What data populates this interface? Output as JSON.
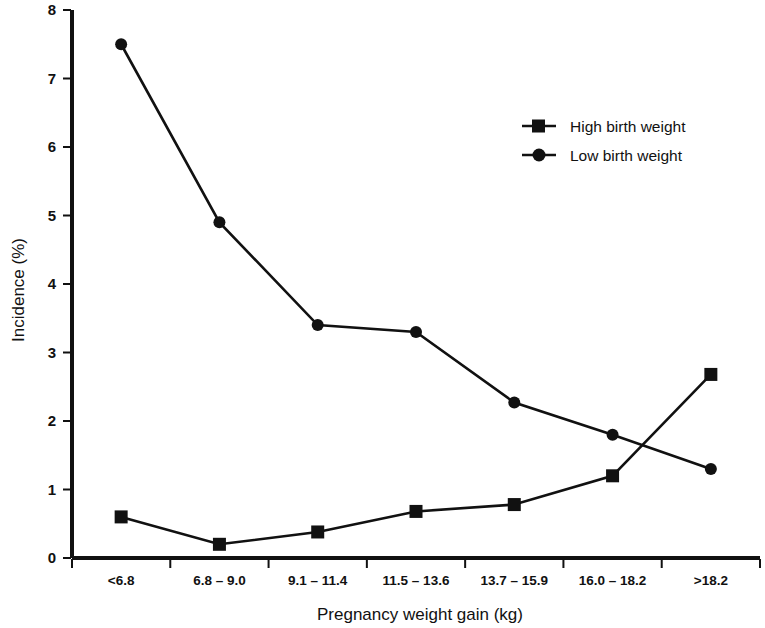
{
  "chart_data": {
    "type": "line",
    "title": "",
    "xlabel": "Pregnancy weight gain (kg)",
    "ylabel": "Incidence (%)",
    "ylim": [
      0,
      8
    ],
    "yticks": [
      "0",
      "1",
      "2",
      "3",
      "4",
      "5",
      "6",
      "7",
      "8"
    ],
    "grid": false,
    "legend_position": "top-right",
    "categories": [
      "<6.8",
      "6.8 – 9.0",
      "9.1 – 11.4",
      "11.5 – 13.6",
      "13.7 – 15.9",
      "16.0 – 18.2",
      ">18.2"
    ],
    "series": [
      {
        "name": "High birth weight",
        "marker": "square",
        "color": "#111111",
        "values": [
          0.6,
          0.2,
          0.38,
          0.68,
          0.78,
          1.2,
          2.68
        ]
      },
      {
        "name": "Low birth weight",
        "marker": "circle",
        "color": "#111111",
        "values": [
          7.5,
          4.9,
          3.4,
          3.3,
          2.27,
          1.8,
          1.3
        ]
      }
    ]
  },
  "legend": {
    "items": [
      {
        "label": "High birth weight",
        "marker": "square"
      },
      {
        "label": "Low birth weight",
        "marker": "circle"
      }
    ]
  },
  "axes": {
    "y_title": "Incidence (%)",
    "x_title": "Pregnancy weight gain (kg)"
  }
}
